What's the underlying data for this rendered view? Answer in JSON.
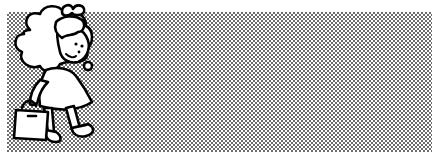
{
  "image": {
    "subject": "cartoon girl with curly hair walking and carrying a handbag",
    "style": "black-and-white clip art",
    "background": "halftone dot pattern",
    "colors": {
      "background": "#ffffff",
      "dots": "#6e6e6e",
      "outline": "#000000",
      "fill": "#ffffff"
    }
  }
}
